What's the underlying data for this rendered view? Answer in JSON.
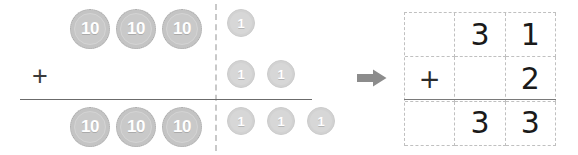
{
  "problem": {
    "description": "Place-value disc addition model with matching vertical algorithm",
    "addend_1": 31,
    "addend_2": 2,
    "sum": 33,
    "operator": "+"
  },
  "disc_model": {
    "tens_column": {
      "top_row_label": "10",
      "top_row_discs": [
        "10",
        "10",
        "10"
      ],
      "middle_row_discs": [],
      "bottom_row_discs": [
        "10",
        "10",
        "10"
      ]
    },
    "ones_column": {
      "top_row_discs": [
        "1"
      ],
      "middle_row_discs": [
        "1",
        "1"
      ],
      "bottom_row_discs": [
        "1",
        "1",
        "1"
      ]
    },
    "operator_label": "+",
    "divider": "place-value-dashed-divider",
    "rule": "sum-horizontal-rule"
  },
  "arrow": {
    "icon": "arrow-right-icon",
    "color": "#8c8c8c"
  },
  "algorithm_grid": {
    "columns": [
      "operator",
      "tens",
      "ones"
    ],
    "rows": [
      {
        "name": "addend-1-row",
        "cells": [
          "",
          "3",
          "1"
        ]
      },
      {
        "name": "addend-2-row",
        "cells": [
          "+",
          "",
          "2"
        ]
      },
      {
        "name": "sum-row",
        "cells": [
          "",
          "3",
          "3"
        ]
      }
    ],
    "rule": "sum-horizontal-rule"
  },
  "colors": {
    "ten_disc": "#c4c4c4",
    "one_disc": "#d2d2d2",
    "disc_text": "#ffffff",
    "dashed_line": "#c0c0c0",
    "solid_rule": "#6b6b6b",
    "digit_text": "#1a1a1a",
    "arrow": "#8c8c8c",
    "background": "#ffffff"
  }
}
